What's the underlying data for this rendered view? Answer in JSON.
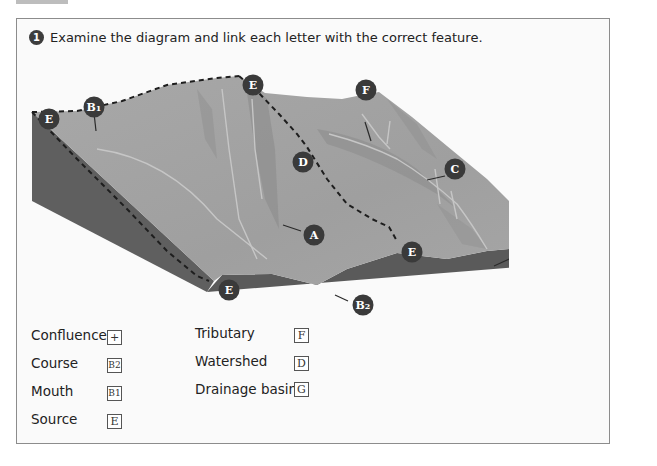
{
  "exercise": {
    "number": "1",
    "instruction": "Examine the diagram and link each letter with the correct feature."
  },
  "diagram": {
    "markers": [
      {
        "id": "E1",
        "label": "E"
      },
      {
        "id": "B1",
        "label": "B1"
      },
      {
        "id": "E2",
        "label": "E"
      },
      {
        "id": "F",
        "label": "F"
      },
      {
        "id": "D",
        "label": "D"
      },
      {
        "id": "C",
        "label": "C"
      },
      {
        "id": "A",
        "label": "A"
      },
      {
        "id": "E3",
        "label": "E"
      },
      {
        "id": "G",
        "label": "G"
      },
      {
        "id": "E4",
        "label": "E"
      },
      {
        "id": "B2",
        "label": "B2"
      }
    ],
    "colors": {
      "surface": "#a3a3a3",
      "surface_dark": "#8e8e8e",
      "side": "#5e5e5e",
      "marker": "#3a3a3a",
      "stream": "#c4c4c4"
    }
  },
  "legend": {
    "left": [
      {
        "label": "Confluence",
        "answer": "+"
      },
      {
        "label": "Course",
        "answer": "B2"
      },
      {
        "label": "Mouth",
        "answer": "B1"
      },
      {
        "label": "Source",
        "answer": "E"
      }
    ],
    "right": [
      {
        "label": "Tributary",
        "answer": "F"
      },
      {
        "label": "Watershed",
        "answer": "D"
      },
      {
        "label": "Drainage basin",
        "answer": "G"
      }
    ]
  }
}
